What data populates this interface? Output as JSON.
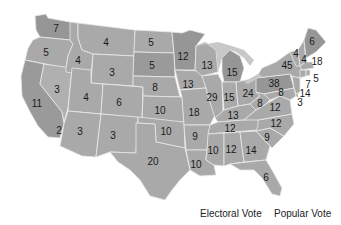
{
  "colors": {
    "state_default": "#a9a9a9",
    "state_dark": "#969696",
    "state_light": "#b4b4b4",
    "lakes": "#c8c8c8",
    "border": "#e8e8e8"
  },
  "states": [
    {
      "id": "WA",
      "value": "7",
      "x": 56,
      "y": 29
    },
    {
      "id": "OR",
      "value": "5",
      "x": 46,
      "y": 53
    },
    {
      "id": "CA",
      "value": "11",
      "x": 37,
      "y": 104
    },
    {
      "id": "NV",
      "value": "3",
      "x": 57,
      "y": 90
    },
    {
      "id": "ID",
      "value": "4",
      "x": 78,
      "y": 61
    },
    {
      "id": "MT",
      "value": "4",
      "x": 106,
      "y": 43
    },
    {
      "id": "WY",
      "value": "3",
      "x": 112,
      "y": 73
    },
    {
      "id": "UT",
      "value": "4",
      "x": 86,
      "y": 98
    },
    {
      "id": "AZ",
      "value": "3",
      "x": 80,
      "y": 132
    },
    {
      "id": "HI",
      "value": "2",
      "x": 59,
      "y": 131
    },
    {
      "id": "CO",
      "value": "6",
      "x": 119,
      "y": 103
    },
    {
      "id": "NM",
      "value": "3",
      "x": 113,
      "y": 136
    },
    {
      "id": "ND",
      "value": "5",
      "x": 151,
      "y": 43
    },
    {
      "id": "SD",
      "value": "5",
      "x": 152,
      "y": 66
    },
    {
      "id": "NE",
      "value": "8",
      "x": 155,
      "y": 88
    },
    {
      "id": "KS",
      "value": "10",
      "x": 160,
      "y": 111
    },
    {
      "id": "OK",
      "value": "10",
      "x": 166,
      "y": 132
    },
    {
      "id": "TX",
      "value": "20",
      "x": 153,
      "y": 162
    },
    {
      "id": "MN",
      "value": "12",
      "x": 183,
      "y": 57
    },
    {
      "id": "IA",
      "value": "13",
      "x": 188,
      "y": 85
    },
    {
      "id": "MO",
      "value": "18",
      "x": 194,
      "y": 113
    },
    {
      "id": "AR",
      "value": "9",
      "x": 195,
      "y": 137
    },
    {
      "id": "LA",
      "value": "10",
      "x": 196,
      "y": 165
    },
    {
      "id": "WI",
      "value": "13",
      "x": 207,
      "y": 66
    },
    {
      "id": "IL",
      "value": "29",
      "x": 212,
      "y": 98
    },
    {
      "id": "MI",
      "value": "15",
      "x": 232,
      "y": 73
    },
    {
      "id": "IN",
      "value": "15",
      "x": 229,
      "y": 98
    },
    {
      "id": "OH",
      "value": "24",
      "x": 248,
      "y": 94
    },
    {
      "id": "KY",
      "value": "13",
      "x": 233,
      "y": 116
    },
    {
      "id": "TN",
      "value": "12",
      "x": 230,
      "y": 129
    },
    {
      "id": "MS",
      "value": "10",
      "x": 213,
      "y": 151
    },
    {
      "id": "AL",
      "value": "12",
      "x": 231,
      "y": 150
    },
    {
      "id": "GA",
      "value": "14",
      "x": 251,
      "y": 151
    },
    {
      "id": "FL",
      "value": "6",
      "x": 266,
      "y": 178
    },
    {
      "id": "SC",
      "value": "9",
      "x": 267,
      "y": 138
    },
    {
      "id": "NC",
      "value": "12",
      "x": 276,
      "y": 124
    },
    {
      "id": "VA",
      "value": "12",
      "x": 275,
      "y": 108
    },
    {
      "id": "WV",
      "value": "8",
      "x": 260,
      "y": 104
    },
    {
      "id": "PA",
      "value": "38",
      "x": 274,
      "y": 84
    },
    {
      "id": "MD",
      "value": "8",
      "x": 281,
      "y": 93
    },
    {
      "id": "DE",
      "value": "3",
      "x": 300,
      "y": 103
    },
    {
      "id": "NJ",
      "value": "14",
      "x": 305,
      "y": 94
    },
    {
      "id": "CT",
      "value": "7",
      "x": 308,
      "y": 85
    },
    {
      "id": "RI",
      "value": "5",
      "x": 316,
      "y": 79
    },
    {
      "id": "MA",
      "value": "18",
      "x": 317,
      "y": 62
    },
    {
      "id": "NY",
      "value": "45",
      "x": 287,
      "y": 66
    },
    {
      "id": "VT",
      "value": "4",
      "x": 296,
      "y": 54
    },
    {
      "id": "NH",
      "value": "4",
      "x": 304,
      "y": 60
    },
    {
      "id": "ME",
      "value": "6",
      "x": 312,
      "y": 42
    }
  ],
  "tabs": [
    {
      "label": "Electoral Vote"
    },
    {
      "label": "Popular Vote"
    }
  ]
}
